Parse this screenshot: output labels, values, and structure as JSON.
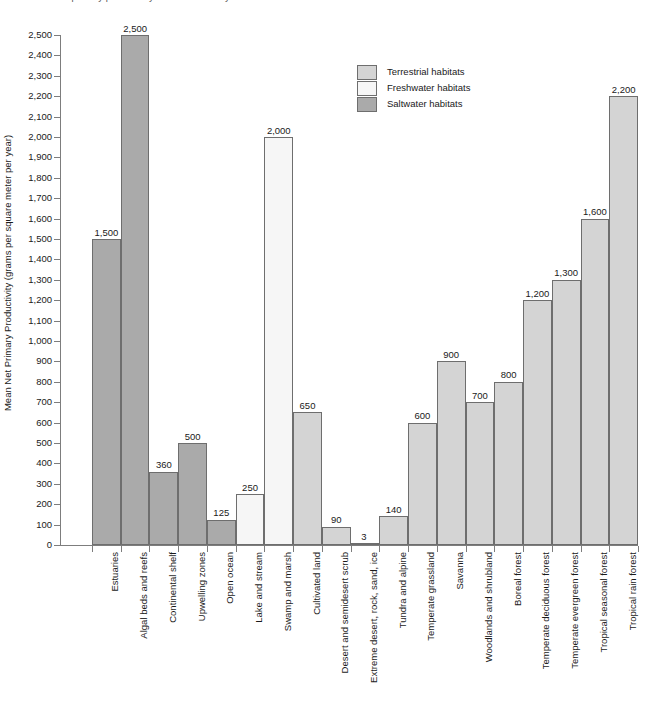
{
  "top_caption": "Net primary productivity of selected ecosystems",
  "chart_data": {
    "type": "bar",
    "title": "",
    "xlabel": "",
    "ylabel": "Mean Net Primary Productivity (grams per square meter per year)",
    "ylim": [
      0,
      2500
    ],
    "ytick_step": 100,
    "grid": false,
    "legend_position": "inside-top-center",
    "yticks": [
      "0",
      "100",
      "200",
      "300",
      "400",
      "500",
      "600",
      "700",
      "800",
      "900",
      "1,000",
      "1,100",
      "1,200",
      "1,300",
      "1,400",
      "1,500",
      "1,600",
      "1,700",
      "1,800",
      "1,900",
      "2,000",
      "2,100",
      "2,200",
      "2,300",
      "2,400",
      "2,500"
    ],
    "categories": [
      "Estuaries",
      "Algal beds and reefs",
      "Continental shelf",
      "Upwelling zones",
      "Open ocean",
      "Lake and stream",
      "Swamp and marsh",
      "Cultivated land",
      "Desert and semidesert scrub",
      "Extreme desert, rock, sand, ice",
      "Tundra and alpine",
      "Temperate grassland",
      "Savanna",
      "Woodlands and shrubland",
      "Boreal forest",
      "Temperate deciduous forest",
      "Temperate evergreen forest",
      "Tropical seasonal forest",
      "Tropical rain forest"
    ],
    "values": [
      1500,
      2500,
      360,
      500,
      125,
      250,
      2000,
      650,
      90,
      3,
      140,
      600,
      900,
      700,
      800,
      1200,
      1300,
      1600,
      2200
    ],
    "value_labels": [
      "1,500",
      "2,500",
      "360",
      "500",
      "125",
      "250",
      "2,000",
      "650",
      "90",
      "3",
      "140",
      "600",
      "900",
      "700",
      "800",
      "1,200",
      "1,300",
      "1,600",
      "2,200"
    ],
    "groups": [
      "saltwater",
      "saltwater",
      "saltwater",
      "saltwater",
      "saltwater",
      "freshwater",
      "freshwater",
      "terrestrial",
      "terrestrial",
      "terrestrial",
      "terrestrial",
      "terrestrial",
      "terrestrial",
      "terrestrial",
      "terrestrial",
      "terrestrial",
      "terrestrial",
      "terrestrial",
      "terrestrial"
    ]
  },
  "legend": {
    "items": [
      {
        "label": "Terrestrial habitats",
        "key": "terrestrial",
        "color": "#d4d4d4"
      },
      {
        "label": "Freshwater habitats",
        "key": "freshwater",
        "color": "#f6f6f6"
      },
      {
        "label": "Saltwater habitats",
        "key": "saltwater",
        "color": "#aaaaaa"
      }
    ]
  },
  "colors": {
    "terrestrial": "#d4d4d4",
    "freshwater": "#f6f6f6",
    "saltwater": "#aaaaaa",
    "bar_stroke": "#6e6e6e",
    "axis": "#7d7d7d",
    "text": "#1a1a1a"
  }
}
